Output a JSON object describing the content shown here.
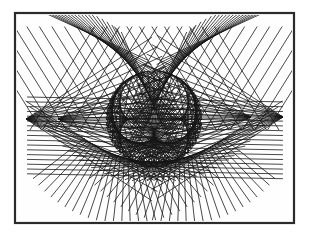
{
  "figure": {
    "canvas": {
      "width": 311,
      "height": 238,
      "background": "#ffffff"
    },
    "frame": {
      "x": 15,
      "y": 13,
      "width": 279,
      "height": 210,
      "stroke": "#2b2b2b",
      "stroke_width": 2.2,
      "fill": "#fefefe"
    },
    "clip": {
      "x": 17,
      "y": 15,
      "width": 275,
      "height": 206
    },
    "line_style": {
      "color": "#161616",
      "width": 0.85,
      "opacity": 0.92
    },
    "families": [
      {
        "name": "central-egg-cardioid-chords",
        "type": "chords",
        "cx": 154,
        "cy": 119,
        "r": 48,
        "multiplier": 2,
        "count": 96,
        "start_deg": -90
      },
      {
        "name": "central-egg-nephroid-chords",
        "type": "chords",
        "cx": 154,
        "cy": 119,
        "r": 48,
        "multiplier": 3,
        "count": 64,
        "start_deg": -90
      },
      {
        "name": "eyebrow-arc-left",
        "type": "tangent_fan",
        "p0": [
          150,
          98
        ],
        "p1": [
          130,
          52
        ],
        "p2": [
          82,
          30
        ],
        "count": 20,
        "extend": 72
      },
      {
        "name": "eyebrow-arc-right",
        "type": "tangent_fan",
        "p0": [
          158,
          98
        ],
        "p1": [
          178,
          52
        ],
        "p2": [
          226,
          30
        ],
        "count": 20,
        "extend": 72
      },
      {
        "name": "top-lattice-left",
        "type": "parallels",
        "x0": 30,
        "y0": 130,
        "dx": 12.5,
        "dy": 0,
        "count": 20,
        "angle_deg": -58,
        "length": 122
      },
      {
        "name": "top-lattice-right",
        "type": "parallels",
        "x0": 279,
        "y0": 130,
        "dx": -12.5,
        "dy": 0,
        "count": 20,
        "angle_deg": -122,
        "length": 122
      },
      {
        "name": "wing-left-outer",
        "type": "spokes",
        "cx": 26,
        "cy": 119,
        "r0": 0,
        "r1": 150,
        "from_deg": -33,
        "to_deg": 33,
        "count": 17
      },
      {
        "name": "wing-left-inner",
        "type": "spokes",
        "cx": 58,
        "cy": 119,
        "r0": 0,
        "r1": 118,
        "from_deg": -26,
        "to_deg": 26,
        "count": 12
      },
      {
        "name": "wing-right-outer",
        "type": "spokes",
        "cx": 283,
        "cy": 117,
        "r0": 0,
        "r1": 150,
        "from_deg": 147,
        "to_deg": 213,
        "count": 17
      },
      {
        "name": "wing-right-inner",
        "type": "spokes",
        "cx": 251,
        "cy": 117,
        "r0": 0,
        "r1": 118,
        "from_deg": 154,
        "to_deg": 206,
        "count": 12
      },
      {
        "name": "mid-horizontal-hatch",
        "type": "parallels",
        "x0": 27,
        "y0": 97,
        "dx": 0,
        "dy": 4.8,
        "count": 17,
        "angle_deg": 1.1,
        "length": 256
      },
      {
        "name": "bottom-smile-arc",
        "type": "tangent_fan",
        "p0": [
          86,
          140
        ],
        "p1": [
          154,
          184
        ],
        "p2": [
          222,
          140
        ],
        "count": 24,
        "extend": 72
      },
      {
        "name": "bottom-fringe-left",
        "type": "spokes",
        "cx": 126,
        "cy": 106,
        "r0": 52,
        "r1": 118,
        "from_deg": 38,
        "to_deg": 142,
        "count": 26
      },
      {
        "name": "bottom-fringe-right",
        "type": "spokes",
        "cx": 182,
        "cy": 106,
        "r0": 52,
        "r1": 118,
        "from_deg": 38,
        "to_deg": 142,
        "count": 26
      }
    ]
  }
}
